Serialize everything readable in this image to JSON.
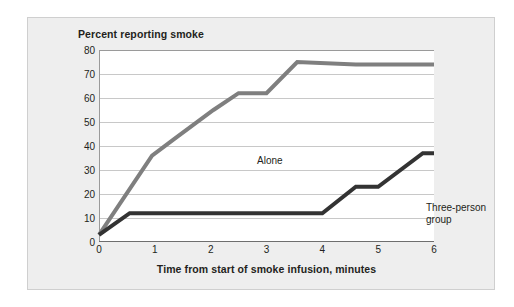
{
  "chart_data": {
    "type": "line",
    "title": "Percent reporting smoke",
    "xlabel": "Time from start of smoke infusion, minutes",
    "ylabel": "Percent reporting smoke",
    "xlim": [
      0,
      6
    ],
    "ylim": [
      0,
      80
    ],
    "xticks": [
      "0",
      "1",
      "2",
      "3",
      "4",
      "5",
      "6"
    ],
    "yticks": [
      "0",
      "10",
      "20",
      "30",
      "40",
      "50",
      "60",
      "70",
      "80"
    ],
    "grid": true,
    "legend_position": "inline-labels",
    "series": [
      {
        "name": "Alone",
        "color": "#7f7f7f",
        "points": [
          [
            0.0,
            3
          ],
          [
            0.95,
            36
          ],
          [
            1.35,
            43
          ],
          [
            2.05,
            55
          ],
          [
            2.5,
            62
          ],
          [
            3.0,
            62
          ],
          [
            3.55,
            75
          ],
          [
            4.6,
            74
          ],
          [
            6.0,
            74
          ]
        ]
      },
      {
        "name": "Three-person group",
        "color": "#333333",
        "points": [
          [
            0.0,
            3
          ],
          [
            0.55,
            12
          ],
          [
            4.0,
            12
          ],
          [
            4.6,
            23
          ],
          [
            5.0,
            23
          ],
          [
            5.8,
            37
          ],
          [
            6.0,
            37
          ]
        ]
      }
    ],
    "annotations": [
      {
        "text": "Alone",
        "x": 1.1,
        "y": 52
      },
      {
        "text": "Three-person",
        "x": 4.1,
        "y": 41
      },
      {
        "text": "group",
        "x": 4.1,
        "y": 36
      }
    ],
    "colors": {
      "series_alone": "#7f7f7f",
      "series_group": "#333333",
      "gridline": "#c8c8c8",
      "panel_background": "#eeeeee",
      "plot_background": "#ffffff",
      "panel_border": "#cfcfcf",
      "text": "#231f20"
    }
  },
  "labels": {
    "series_group_line1": "Three-person",
    "series_group_line2": "group",
    "series_alone": "Alone"
  }
}
